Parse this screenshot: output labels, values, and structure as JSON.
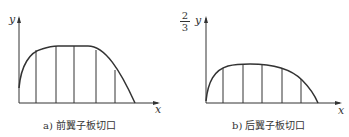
{
  "figures": [
    {
      "id": "a",
      "caption": "a) 前翼子板切口",
      "y_label": "y",
      "x_label": "x"
    },
    {
      "id": "b",
      "caption": "b) 后翼子板切口",
      "y_label": "y",
      "y_prefix": {
        "numerator": "2",
        "denominator": "3"
      },
      "x_label": "x"
    }
  ]
}
